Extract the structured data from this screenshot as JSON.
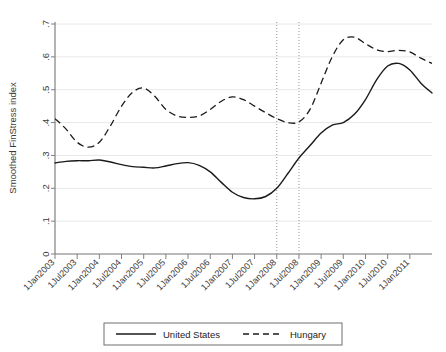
{
  "chart_data": {
    "type": "line",
    "title": "",
    "xlabel": "",
    "ylabel": "Smoothed FinStress index",
    "ylim": [
      0,
      0.7
    ],
    "yticks": [
      "0",
      ".1",
      ".2",
      ".3",
      ".4",
      ".5",
      ".6",
      ".7"
    ],
    "ytick_values": [
      0,
      0.1,
      0.2,
      0.3,
      0.4,
      0.5,
      0.6,
      0.7
    ],
    "grid": "horizontal",
    "legend_position": "bottom-outside",
    "categories": [
      "1Jan2003",
      "1Jul2003",
      "1Jan2004",
      "1Jul2004",
      "1Jan2005",
      "1Jul2005",
      "1Jan2006",
      "1Jul2006",
      "1Jan2007",
      "1Jul2007",
      "1Jan2008",
      "1Jul2008",
      "1Jan2009",
      "1Jul2009",
      "1Jan2010",
      "1Jul2010",
      "1Jan2011"
    ],
    "annotations": [
      {
        "name": "reference-line-1",
        "type": "vline",
        "x": "1Jan2008"
      },
      {
        "name": "reference-line-2",
        "type": "vline",
        "x": "1Jul2008"
      }
    ],
    "series": [
      {
        "name": "United States",
        "style": "solid",
        "color": "#1a1a1a",
        "x": [
          "1Jan2003",
          "1Apr2003",
          "1Jul2003",
          "1Oct2003",
          "1Jan2004",
          "1Apr2004",
          "1Jul2004",
          "1Oct2004",
          "1Jan2005",
          "1Apr2005",
          "1Jul2005",
          "1Oct2005",
          "1Jan2006",
          "1Apr2006",
          "1Jul2006",
          "1Oct2006",
          "1Jan2007",
          "1Apr2007",
          "1Jul2007",
          "1Oct2007",
          "1Jan2008",
          "1Apr2008",
          "1Jul2008",
          "1Oct2008",
          "1Jan2009",
          "1Apr2009",
          "1Jul2009",
          "1Oct2009",
          "1Jan2010",
          "1Apr2010",
          "1Jul2010",
          "1Oct2010",
          "1Jan2011",
          "1Apr2011",
          "1Jul2011"
        ],
        "values": [
          0.277,
          0.282,
          0.284,
          0.284,
          0.286,
          0.28,
          0.272,
          0.266,
          0.264,
          0.262,
          0.268,
          0.275,
          0.278,
          0.27,
          0.25,
          0.218,
          0.188,
          0.172,
          0.168,
          0.175,
          0.2,
          0.245,
          0.292,
          0.33,
          0.368,
          0.392,
          0.4,
          0.425,
          0.47,
          0.53,
          0.572,
          0.58,
          0.56,
          0.52,
          0.49
        ]
      },
      {
        "name": "Hungary",
        "style": "dashed",
        "color": "#1a1a1a",
        "x": [
          "1Jan2003",
          "1Apr2003",
          "1Jul2003",
          "1Oct2003",
          "1Jan2004",
          "1Apr2004",
          "1Jul2004",
          "1Oct2004",
          "1Jan2005",
          "1Apr2005",
          "1Jul2005",
          "1Oct2005",
          "1Jan2006",
          "1Apr2006",
          "1Jul2006",
          "1Oct2006",
          "1Jan2007",
          "1Apr2007",
          "1Jul2007",
          "1Oct2007",
          "1Jan2008",
          "1Apr2008",
          "1Jul2008",
          "1Oct2008",
          "1Jan2009",
          "1Apr2009",
          "1Jul2009",
          "1Oct2009",
          "1Jan2010",
          "1Apr2010",
          "1Jul2010",
          "1Oct2010",
          "1Jan2011",
          "1Apr2011",
          "1Jul2011"
        ],
        "values": [
          0.412,
          0.38,
          0.34,
          0.325,
          0.34,
          0.39,
          0.45,
          0.492,
          0.505,
          0.48,
          0.44,
          0.42,
          0.416,
          0.42,
          0.44,
          0.465,
          0.478,
          0.47,
          0.45,
          0.43,
          0.412,
          0.4,
          0.402,
          0.44,
          0.52,
          0.6,
          0.652,
          0.66,
          0.64,
          0.622,
          0.616,
          0.62,
          0.615,
          0.596,
          0.58
        ]
      }
    ]
  },
  "legend": {
    "entries": [
      {
        "label": "United States",
        "style": "solid"
      },
      {
        "label": "Hungary",
        "style": "dashed"
      }
    ]
  }
}
